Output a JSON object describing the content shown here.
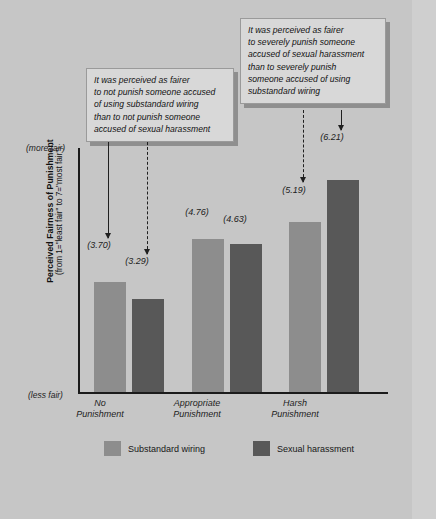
{
  "chart_data": {
    "type": "bar",
    "title": "",
    "categories": [
      "No Punishment",
      "Appropriate Punishment",
      "Harsh Punishment"
    ],
    "series": [
      {
        "name": "Substandard wiring",
        "color": "#8d8d8d",
        "values": [
          3.7,
          4.76,
          5.19
        ],
        "labels": [
          "(3.70)",
          "(4.76)",
          "(5.19)"
        ]
      },
      {
        "name": "Sexual harassment",
        "color": "#585858",
        "values": [
          3.29,
          4.63,
          6.21
        ],
        "labels": [
          "(3.29)",
          "(4.63)",
          "(6.21)"
        ]
      }
    ],
    "xlabel": "",
    "ylabel": "Perceived Fairness of Punishment",
    "ylabel_sub": "(from 1=\"least fair\" to 7=\"most fair\")",
    "ylim": [
      1,
      7
    ],
    "grid": false,
    "legend_position": "bottom"
  },
  "axis": {
    "more_fair": "(more fair)",
    "less_fair": "(less fair)",
    "y_title": "Perceived Fairness of Punishment",
    "y_subtitle": "(from 1=\"least fair\" to 7=\"most fair\")"
  },
  "categories": [
    {
      "line1": "No",
      "line2": "Punishment"
    },
    {
      "line1": "Appropriate",
      "line2": "Punishment"
    },
    {
      "line1": "Harsh",
      "line2": "Punishment"
    }
  ],
  "bars": [
    {
      "label": "(3.70)"
    },
    {
      "label": "(3.29)"
    },
    {
      "label": "(4.76)"
    },
    {
      "label": "(4.63)"
    },
    {
      "label": "(5.19)"
    },
    {
      "label": "(6.21)"
    }
  ],
  "callouts": [
    {
      "id": "callout-left",
      "lines": [
        "It was perceived as fairer",
        "to not punish someone accused",
        "of using substandard wiring",
        "than to not punish someone",
        "accused of sexual harassment"
      ]
    },
    {
      "id": "callout-right",
      "lines": [
        "It was perceived as fairer",
        "to severely punish someone",
        "accused of sexual harassment",
        "than to severely punish",
        "someone accused of using",
        "substandard wiring"
      ]
    }
  ],
  "legend": [
    {
      "label": "Substandard wiring",
      "color": "#8d8d8d"
    },
    {
      "label": "Sexual harassment",
      "color": "#585858"
    }
  ]
}
